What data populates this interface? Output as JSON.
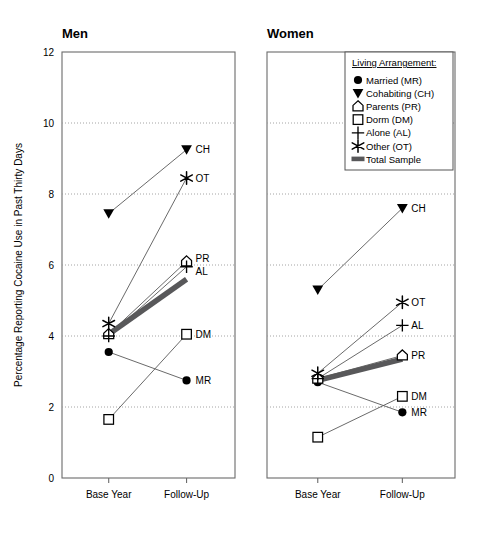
{
  "figure": {
    "ylabel": "Percentage Reporting Cocaine Use in Past Thirty Days",
    "panels": [
      "Men",
      "Women"
    ]
  },
  "legend": {
    "title": "Living Arrangement:",
    "items": [
      {
        "label": "Married (MR)",
        "marker": "filled-circle-icon"
      },
      {
        "label": "Cohabiting (CH)",
        "marker": "filled-down-triangle-icon"
      },
      {
        "label": "Parents (PR)",
        "marker": "open-house-pentagon-icon"
      },
      {
        "label": "Dorm (DM)",
        "marker": "open-square-icon"
      },
      {
        "label": "Alone (AL)",
        "marker": "plus-cross-icon"
      },
      {
        "label": "Other (OT)",
        "marker": "asterisk-star-icon"
      },
      {
        "label": "Total Sample",
        "marker": "thick-gray-bar-icon"
      }
    ]
  },
  "chart_data": {
    "type": "line",
    "title": "",
    "xlabel": "",
    "ylabel": "Percentage Reporting Cocaine Use in Past Thirty Days",
    "x": [
      "Base Year",
      "Follow-Up"
    ],
    "xticklabels": [
      "Base Year",
      "Follow-Up"
    ],
    "yticklabels": [
      "0",
      "2",
      "4",
      "6",
      "8",
      "10",
      "12"
    ],
    "yticks": [
      0,
      2,
      4,
      6,
      8,
      10,
      12
    ],
    "ylim": [
      0,
      12
    ],
    "grid": "horizontal-dotted",
    "legend_position": "top-right-of-women-panel",
    "panels": [
      {
        "name": "Men",
        "title": "Men",
        "series": [
          {
            "name": "Married (MR)",
            "code": "MR",
            "marker": "filled-circle-icon",
            "values": [
              3.55,
              2.75
            ],
            "endlabel": "MR"
          },
          {
            "name": "Cohabiting (CH)",
            "code": "CH",
            "marker": "filled-down-triangle-icon",
            "values": [
              7.45,
              9.25
            ],
            "endlabel": "CH"
          },
          {
            "name": "Parents (PR)",
            "code": "PR",
            "marker": "open-house-pentagon-icon",
            "values": [
              4.05,
              6.1
            ],
            "endlabel": "PR"
          },
          {
            "name": "Dorm (DM)",
            "code": "DM",
            "marker": "open-square-icon",
            "values": [
              1.65,
              4.05
            ],
            "endlabel": "DM"
          },
          {
            "name": "Alone (AL)",
            "code": "AL",
            "marker": "plus-cross-icon",
            "values": [
              4.0,
              5.95
            ],
            "endlabel": "AL"
          },
          {
            "name": "Other (OT)",
            "code": "OT",
            "marker": "asterisk-star-icon",
            "values": [
              4.35,
              8.45
            ],
            "endlabel": "OT"
          },
          {
            "name": "Total Sample",
            "code": "TS",
            "marker": "thick-gray-bar-icon",
            "values": [
              4.05,
              5.6
            ],
            "endlabel": ""
          }
        ]
      },
      {
        "name": "Women",
        "title": "Women",
        "series": [
          {
            "name": "Married (MR)",
            "code": "MR",
            "marker": "filled-circle-icon",
            "values": [
              2.7,
              1.85
            ],
            "endlabel": "MR"
          },
          {
            "name": "Cohabiting (CH)",
            "code": "CH",
            "marker": "filled-down-triangle-icon",
            "values": [
              5.3,
              7.6
            ],
            "endlabel": "CH"
          },
          {
            "name": "Parents (PR)",
            "code": "PR",
            "marker": "open-house-pentagon-icon",
            "values": [
              2.8,
              3.45
            ],
            "endlabel": "PR"
          },
          {
            "name": "Dorm (DM)",
            "code": "DM",
            "marker": "open-square-icon",
            "values": [
              1.15,
              2.3
            ],
            "endlabel": "DM"
          },
          {
            "name": "Alone (AL)",
            "code": "AL",
            "marker": "plus-cross-icon",
            "values": [
              2.8,
              4.3
            ],
            "endlabel": "AL"
          },
          {
            "name": "Other (OT)",
            "code": "OT",
            "marker": "asterisk-star-icon",
            "values": [
              2.95,
              4.95
            ],
            "endlabel": "OT"
          },
          {
            "name": "Total Sample",
            "code": "TS",
            "marker": "thick-gray-bar-icon",
            "values": [
              2.75,
              3.35
            ],
            "endlabel": ""
          }
        ]
      }
    ]
  },
  "colors": {
    "axis": "#6b6b6b",
    "line": "#595959",
    "marker": "#000000",
    "grid": "#9a9a9a",
    "total_sample": "#58585a",
    "text": "#000000"
  }
}
